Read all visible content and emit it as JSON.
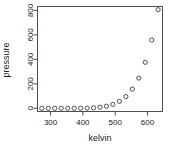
{
  "chart_data": {
    "type": "scatter",
    "title": "",
    "xlabel": "kelvin",
    "ylabel": "pressure",
    "x": [
      273,
      293,
      313,
      333,
      353,
      373,
      393,
      413,
      433,
      453,
      473,
      493,
      513,
      533,
      553,
      573,
      593,
      613,
      633
    ],
    "values": [
      0.0002,
      0.0012,
      0.006,
      0.03,
      0.09,
      0.27,
      0.75,
      1.85,
      4.2,
      8.8,
      17.3,
      32.1,
      57.0,
      96.0,
      157.0,
      247.0,
      376.0,
      558.0,
      806.0
    ],
    "series": [
      {
        "name": "pressure",
        "values": [
          0.0002,
          0.0012,
          0.006,
          0.03,
          0.09,
          0.27,
          0.75,
          1.85,
          4.2,
          8.8,
          17.3,
          32.1,
          57.0,
          96.0,
          157.0,
          247.0,
          376.0,
          558.0,
          806.0
        ]
      }
    ],
    "xticks": [
      300,
      400,
      500,
      600
    ],
    "yticks": [
      0,
      200,
      400,
      600,
      800
    ],
    "xlim": [
      258,
      648
    ],
    "ylim": [
      -30,
      836
    ],
    "grid": false,
    "legend": false,
    "marker": "open-circle",
    "marker_color": "#3d3d3d",
    "background_color": "#ffffff",
    "frame_color": "#4d4d4d"
  },
  "plot": {
    "frame": {
      "left": 37,
      "top": 6,
      "right": 163,
      "bottom": 112
    },
    "xaxis_title_y": 141,
    "yaxis_title_x": 9
  }
}
